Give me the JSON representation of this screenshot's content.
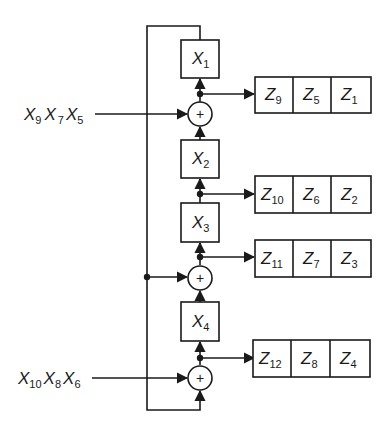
{
  "diagram": {
    "type": "block-diagram",
    "colors": {
      "line": "#1a1a1a",
      "background": "#ffffff"
    },
    "inputs": [
      {
        "id": "in1",
        "terms": [
          {
            "base": "X",
            "sub": "9"
          },
          {
            "base": "X",
            "sub": "7"
          },
          {
            "base": "X",
            "sub": "5"
          }
        ]
      },
      {
        "id": "in2",
        "terms": [
          {
            "base": "X",
            "sub": "10"
          },
          {
            "base": "X",
            "sub": "8"
          },
          {
            "base": "X",
            "sub": "6"
          }
        ]
      }
    ],
    "cells": [
      {
        "id": "x1",
        "base": "X",
        "sub": "1"
      },
      {
        "id": "x2",
        "base": "X",
        "sub": "2"
      },
      {
        "id": "x3",
        "base": "X",
        "sub": "3"
      },
      {
        "id": "x4",
        "base": "X",
        "sub": "4"
      }
    ],
    "adders": [
      {
        "id": "adder1",
        "symbol": "+"
      },
      {
        "id": "adder2",
        "symbol": "+"
      },
      {
        "id": "adder3",
        "symbol": "+"
      }
    ],
    "outputs": [
      {
        "id": "out1",
        "cells": [
          {
            "base": "Z",
            "sub": "9"
          },
          {
            "base": "Z",
            "sub": "5"
          },
          {
            "base": "Z",
            "sub": "1"
          }
        ]
      },
      {
        "id": "out2",
        "cells": [
          {
            "base": "Z",
            "sub": "10"
          },
          {
            "base": "Z",
            "sub": "6"
          },
          {
            "base": "Z",
            "sub": "2"
          }
        ]
      },
      {
        "id": "out3",
        "cells": [
          {
            "base": "Z",
            "sub": "11"
          },
          {
            "base": "Z",
            "sub": "7"
          },
          {
            "base": "Z",
            "sub": "3"
          }
        ]
      },
      {
        "id": "out4",
        "cells": [
          {
            "base": "Z",
            "sub": "12"
          },
          {
            "base": "Z",
            "sub": "8"
          },
          {
            "base": "Z",
            "sub": "4"
          }
        ]
      }
    ]
  }
}
